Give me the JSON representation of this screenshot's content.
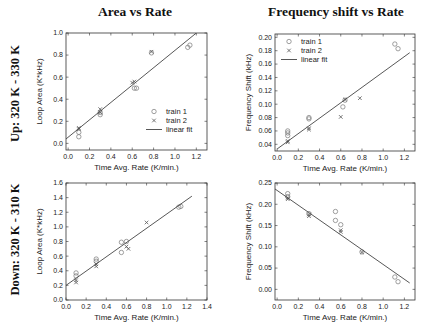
{
  "column_titles": [
    "Area vs Rate",
    "Frequency shift vs Rate"
  ],
  "row_labels": [
    "Up: 320 K - 330 K",
    "Down: 320 K - 310 K"
  ],
  "colors": {
    "axis": "#333333",
    "marker_train1": "#777777",
    "marker_train2": "#555555",
    "fit_line": "#444444"
  },
  "chart_data": [
    {
      "id": "area-up",
      "type": "scatter",
      "title": "Area vs Rate",
      "row": "Up: 320 K - 330 K",
      "xlabel": "Time Avg. Rate (K/min.)",
      "ylabel": "Loop Area (K*kHz)",
      "xlim": [
        -0.02,
        1.3
      ],
      "ylim": [
        -0.06,
        1.0
      ],
      "xticks": [
        0.0,
        0.2,
        0.4,
        0.6,
        0.8,
        1.0,
        1.2
      ],
      "xtick_labels": [
        "0.0",
        "0.2",
        "0.4",
        "0.6",
        "0.8",
        "1.0",
        "1.2"
      ],
      "yticks": [
        0.0,
        0.2,
        0.4,
        0.6,
        0.8,
        1.0
      ],
      "ytick_labels": [
        "0.0",
        "0.2",
        "0.4",
        "0.6",
        "0.8",
        "1.0"
      ],
      "frame": {
        "x": 66,
        "y": 33,
        "w": 141,
        "h": 117
      },
      "legend": {
        "position": "lower right",
        "x": 148,
        "y": 114,
        "entries": [
          "train 1",
          "train 2",
          "linear fit"
        ]
      },
      "series": [
        {
          "name": "train 1",
          "marker": "circle",
          "x": [
            0.1,
            0.1,
            0.3,
            0.3,
            0.62,
            0.64,
            0.78,
            1.12,
            1.14
          ],
          "y": [
            0.06,
            0.1,
            0.26,
            0.28,
            0.5,
            0.5,
            0.82,
            0.87,
            0.89
          ]
        },
        {
          "name": "train 2",
          "marker": "x",
          "x": [
            0.1,
            0.1,
            0.3,
            0.3,
            0.6,
            0.62,
            0.78
          ],
          "y": [
            0.13,
            0.14,
            0.28,
            0.31,
            0.55,
            0.56,
            0.83
          ]
        },
        {
          "name": "linear fit",
          "type": "line",
          "x": [
            -0.02,
            1.2
          ],
          "y": [
            0.04,
            1.0
          ]
        }
      ]
    },
    {
      "id": "freq-up",
      "type": "scatter",
      "title": "Frequency shift vs Rate",
      "row": "Up: 320 K - 330 K",
      "xlabel": "Time Avg. Rate (K/min.)",
      "ylabel": "Frequency Shift (kHz)",
      "xlim": [
        -0.02,
        1.3
      ],
      "ylim": [
        0.03,
        0.205
      ],
      "xticks": [
        0.0,
        0.2,
        0.4,
        0.6,
        0.8,
        1.0,
        1.2
      ],
      "xtick_labels": [
        "0.0",
        "0.2",
        "0.4",
        "0.6",
        "0.8",
        "1.0",
        "1.2"
      ],
      "yticks": [
        0.04,
        0.06,
        0.08,
        0.1,
        0.12,
        0.14,
        0.16,
        0.18,
        0.2
      ],
      "ytick_labels": [
        "0.04",
        "0.06",
        "0.08",
        "0.10",
        "0.12",
        "0.14",
        "0.16",
        "0.18",
        "0.20"
      ],
      "frame": {
        "x": 275,
        "y": 34,
        "w": 140,
        "h": 117
      },
      "legend": {
        "position": "upper left",
        "x": 283,
        "y": 44,
        "entries": [
          "train 1",
          "train 2",
          "linear fit"
        ]
      },
      "series": [
        {
          "name": "train 1",
          "marker": "circle",
          "x": [
            0.1,
            0.1,
            0.1,
            0.3,
            0.3,
            0.62,
            0.64,
            1.11,
            1.14
          ],
          "y": [
            0.053,
            0.057,
            0.06,
            0.078,
            0.08,
            0.096,
            0.106,
            0.19,
            0.183
          ]
        },
        {
          "name": "train 2",
          "marker": "x",
          "x": [
            0.1,
            0.1,
            0.3,
            0.3,
            0.6,
            0.64,
            0.78
          ],
          "y": [
            0.043,
            0.045,
            0.062,
            0.064,
            0.081,
            0.107,
            0.109
          ]
        },
        {
          "name": "linear fit",
          "type": "line",
          "x": [
            0.0,
            1.25
          ],
          "y": [
            0.033,
            0.177
          ]
        }
      ]
    },
    {
      "id": "area-down",
      "type": "scatter",
      "title": "Area vs Rate",
      "row": "Down: 320 K - 310 K",
      "xlabel": "Time Avg. Rate (K/min.)",
      "ylabel": "Loop Area (K*kHz)",
      "xlim": [
        0.0,
        1.4
      ],
      "ylim": [
        0.0,
        1.6
      ],
      "xticks": [
        0.0,
        0.2,
        0.4,
        0.6,
        0.8,
        1.0,
        1.2,
        1.4
      ],
      "xtick_labels": [
        "0.0",
        "0.2",
        "0.4",
        "0.6",
        "0.8",
        "1.0",
        "1.2",
        "1.4"
      ],
      "yticks": [
        0.0,
        0.2,
        0.4,
        0.6,
        0.8,
        1.0,
        1.2,
        1.4,
        1.6
      ],
      "ytick_labels": [
        "0.0",
        "0.2",
        "0.4",
        "0.6",
        "0.8",
        "1.0",
        "1.2",
        "1.4",
        "1.6"
      ],
      "frame": {
        "x": 66,
        "y": 183,
        "w": 141,
        "h": 117
      },
      "legend": null,
      "series": [
        {
          "name": "train 1",
          "marker": "circle",
          "x": [
            0.1,
            0.1,
            0.3,
            0.3,
            0.55,
            0.55,
            0.6,
            1.12,
            1.14
          ],
          "y": [
            0.33,
            0.37,
            0.53,
            0.56,
            0.65,
            0.79,
            0.8,
            1.27,
            1.28
          ]
        },
        {
          "name": "train 2",
          "marker": "x",
          "x": [
            0.1,
            0.1,
            0.3,
            0.3,
            0.6,
            0.62,
            0.8
          ],
          "y": [
            0.24,
            0.27,
            0.46,
            0.49,
            0.73,
            0.7,
            1.06
          ]
        },
        {
          "name": "linear fit",
          "type": "line",
          "x": [
            0.0,
            1.25
          ],
          "y": [
            0.2,
            1.42
          ]
        }
      ]
    },
    {
      "id": "freq-down",
      "type": "scatter",
      "title": "Frequency shift vs Rate",
      "row": "Down: 320 K - 310 K",
      "xlabel": "Time Avg. Rate (K/min.)",
      "ylabel": "Frequency Shift (kHz)",
      "xlim": [
        -0.02,
        1.3
      ],
      "ylim": [
        -0.025,
        0.25
      ],
      "xticks": [
        0.0,
        0.2,
        0.4,
        0.6,
        0.8,
        1.0,
        1.2
      ],
      "xtick_labels": [
        "0.0",
        "0.2",
        "0.4",
        "0.6",
        "0.8",
        "1.0",
        "1.2"
      ],
      "yticks": [
        0.0,
        0.05,
        0.1,
        0.15,
        0.2,
        0.25
      ],
      "ytick_labels": [
        "0.00",
        "0.05",
        "0.10",
        "0.15",
        "0.20",
        "0.25"
      ],
      "frame": {
        "x": 275,
        "y": 183,
        "w": 140,
        "h": 117
      },
      "legend": null,
      "series": [
        {
          "name": "train 1",
          "marker": "circle",
          "x": [
            0.1,
            0.1,
            0.3,
            0.55,
            0.55,
            0.6,
            0.8,
            1.11,
            1.14
          ],
          "y": [
            0.225,
            0.218,
            0.178,
            0.183,
            0.162,
            0.152,
            0.088,
            0.029,
            0.018
          ]
        },
        {
          "name": "train 2",
          "marker": "x",
          "x": [
            0.1,
            0.1,
            0.3,
            0.3,
            0.6,
            0.6,
            0.8
          ],
          "y": [
            0.212,
            0.215,
            0.172,
            0.176,
            0.135,
            0.139,
            0.087
          ]
        },
        {
          "name": "linear fit",
          "type": "line",
          "x": [
            -0.02,
            1.25
          ],
          "y": [
            0.236,
            0.015
          ]
        }
      ]
    }
  ]
}
